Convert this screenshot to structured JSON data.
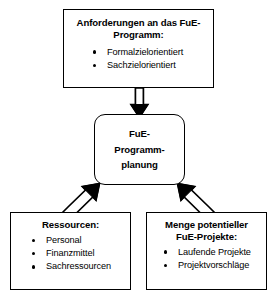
{
  "diagram": {
    "background_color": "#ffffff",
    "line_color": "#000000",
    "boxes": {
      "requirements": {
        "title": "Anforderungen an das FuE-Programm:",
        "items": [
          "Formalzielorientiert",
          "Sachzielorientiert"
        ]
      },
      "planning": {
        "line1": "FuE-",
        "line2": "Programm-",
        "line3": "planung"
      },
      "resources": {
        "title": "Ressourcen:",
        "items": [
          "Personal",
          "Finanzmittel",
          "Sachressourcen"
        ]
      },
      "projects": {
        "title_line1": "Menge potentieller",
        "title_line2": "FuE-Projekte:",
        "items": [
          "Laufende Projekte",
          "Projektvorschläge"
        ]
      }
    },
    "arrows": [
      {
        "name": "arrow-requirements-to-planning",
        "from": "requirements",
        "to": "planning",
        "direction": "down",
        "style": "hollow-double-line"
      },
      {
        "name": "arrow-resources-to-planning",
        "from": "resources",
        "to": "planning",
        "direction": "up-right",
        "style": "hollow-double-line"
      },
      {
        "name": "arrow-projects-to-planning",
        "from": "projects",
        "to": "planning",
        "direction": "up-left",
        "style": "hollow-double-line"
      }
    ]
  }
}
